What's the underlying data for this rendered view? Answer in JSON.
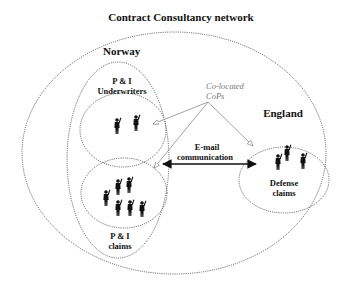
{
  "title": "Contract Consultancy network",
  "regions": {
    "norway": {
      "label": "Norway"
    },
    "england": {
      "label": "England"
    }
  },
  "groups": {
    "underwriters": {
      "label_line1": "P & I",
      "label_line2": "Underwriters",
      "people_count": 2
    },
    "claims": {
      "label_line1": "P & I",
      "label_line2": "claims",
      "people_count": 6
    },
    "defense": {
      "label_line1": "Defense",
      "label_line2": "claims",
      "people_count": 3
    }
  },
  "annotations": {
    "cops_line1": "Co-located",
    "cops_line2": "CoPs",
    "email_line1": "E-mail",
    "email_line2": "communication"
  },
  "colors": {
    "text": "#111111",
    "annotation": "#777777",
    "dotted_border": "#444444",
    "cop_line": "#999999"
  }
}
